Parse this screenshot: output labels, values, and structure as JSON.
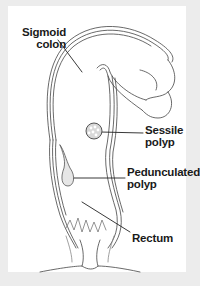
{
  "diagram": {
    "type": "anatomical illustration",
    "background_color": "#ececec",
    "panel_color": "#ffffff",
    "line_color": "#333333",
    "labels": {
      "sigmoid_colon": {
        "line1": "Sigmoid",
        "line2": "colon"
      },
      "sessile_polyp": {
        "line1": "Sessile",
        "line2": "polyp"
      },
      "pedunculated_polyp": {
        "line1": "Pedunculated",
        "line2": "polyp"
      },
      "rectum": {
        "line1": "Rectum"
      }
    }
  }
}
